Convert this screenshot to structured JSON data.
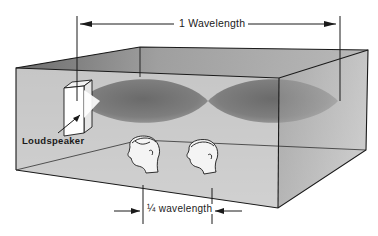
{
  "figure": {
    "type": "standing-wave-room-diagram",
    "labels": {
      "wavelength": "1 Wavelength",
      "loudspeaker": "Loudspeaker",
      "quarter_wavelength": "¼ wavelength"
    },
    "elements": {
      "room": "transparent box in perspective",
      "wave_lobes": 2,
      "listener_heads": 2
    },
    "colors": {
      "background": "#ffffff",
      "line": "#1a1a1a",
      "room_wall": "#c9c9c9",
      "room_top": "#8e8e8e",
      "right_face": "#b3b3b3",
      "wave_lobe": "#7a7a7a"
    }
  }
}
